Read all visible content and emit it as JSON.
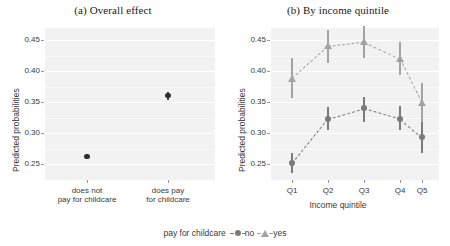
{
  "figure": {
    "panels": [
      {
        "id": "a",
        "title": "(a) Overall effect"
      },
      {
        "id": "b",
        "title": "(b) By income quintile"
      }
    ]
  },
  "legend": {
    "title": "pay for childcare",
    "entries": [
      {
        "label": "no",
        "marker": "circle-marker",
        "color": "#7b7b7b"
      },
      {
        "label": "yes",
        "marker": "triangle-marker",
        "color": "#a3a3a3"
      }
    ]
  },
  "chart_data": [
    {
      "type": "scatter",
      "title": "(a) Overall effect",
      "xlabel": "",
      "ylabel": "Predicted probabilities",
      "ylim": [
        0.225,
        0.47
      ],
      "yticks": [
        0.25,
        0.3,
        0.35,
        0.4,
        0.45
      ],
      "ytick_labels": [
        "0.25",
        "0.30",
        "0.35",
        "0.40",
        "0.45"
      ],
      "categories": [
        "does not\npay for childcare",
        "does pay\nfor childcare"
      ],
      "xtick_labels": [
        [
          "does not",
          "pay for childcare"
        ],
        [
          "does pay",
          "for childcare"
        ]
      ],
      "values": [
        0.263,
        0.361
      ],
      "errors_low": [
        0.26,
        0.356
      ],
      "errors_high": [
        0.266,
        0.366
      ],
      "grid": true,
      "legend_position": "bottom"
    },
    {
      "type": "line",
      "title": "(b) By income quintile",
      "xlabel": "Income quintile",
      "ylabel": "Predicted probabilities",
      "ylim": [
        0.225,
        0.47
      ],
      "yticks": [
        0.25,
        0.3,
        0.35,
        0.4,
        0.45
      ],
      "ytick_labels": [
        "0.25",
        "0.30",
        "0.35",
        "0.40",
        "0.45"
      ],
      "categories": [
        "Q1",
        "Q2",
        "Q3",
        "Q4",
        "Q5"
      ],
      "grid": true,
      "legend_position": "bottom",
      "linestyle": "dashed",
      "series": [
        {
          "name": "no",
          "marker": "circle",
          "color": "#7b7b7b",
          "values": [
            0.252,
            0.324,
            0.341,
            0.324,
            0.294
          ],
          "errors_low": [
            0.236,
            0.306,
            0.318,
            0.305,
            0.269
          ],
          "errors_high": [
            0.268,
            0.343,
            0.359,
            0.344,
            0.319
          ]
        },
        {
          "name": "yes",
          "marker": "triangle",
          "color": "#a3a3a3",
          "values": [
            0.389,
            0.441,
            0.448,
            0.421,
            0.35
          ],
          "errors_low": [
            0.357,
            0.414,
            0.421,
            0.395,
            0.318
          ],
          "errors_high": [
            0.421,
            0.467,
            0.473,
            0.447,
            0.382
          ]
        }
      ]
    }
  ]
}
